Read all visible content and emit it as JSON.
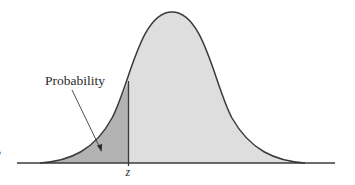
{
  "diagram": {
    "type": "normal-distribution-cdf",
    "labels": {
      "area_label": "Probability",
      "z_label": "z",
      "left_edge_glyph": "e"
    },
    "colors": {
      "background": "#ffffff",
      "curve_fill": "#dedede",
      "shaded_fill": "#b3b3b3",
      "stroke": "#3a3a3a"
    },
    "geometry": {
      "baseline_y": 163,
      "baseline_x_start": 17,
      "baseline_x_end": 335,
      "peak_x": 172,
      "peak_y": 12,
      "z_x": 128.5
    }
  }
}
